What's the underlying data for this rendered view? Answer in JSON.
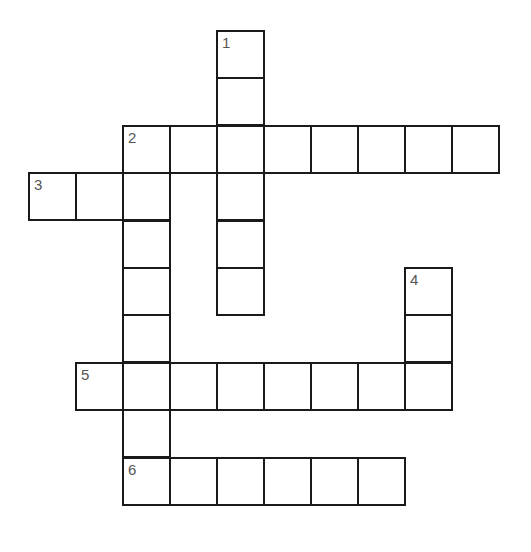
{
  "puzzle": {
    "cell_size": 48,
    "origin_x": 28,
    "origin_y": 30,
    "colors": {
      "border": "#1a1a1a",
      "number": "#555555",
      "background": "#ffffff"
    },
    "clues": [
      {
        "number": "1",
        "direction": "down",
        "row": 0,
        "col": 4,
        "length": 6
      },
      {
        "number": "2",
        "direction": "across",
        "row": 2,
        "col": 2,
        "length": 8
      },
      {
        "number": "2",
        "direction": "down",
        "row": 2,
        "col": 2,
        "length": 8
      },
      {
        "number": "3",
        "direction": "across",
        "row": 3,
        "col": 0,
        "length": 3
      },
      {
        "number": "4",
        "direction": "down",
        "row": 5,
        "col": 8,
        "length": 3
      },
      {
        "number": "5",
        "direction": "across",
        "row": 7,
        "col": 1,
        "length": 8
      },
      {
        "number": "6",
        "direction": "across",
        "row": 9,
        "col": 2,
        "length": 6
      }
    ]
  }
}
